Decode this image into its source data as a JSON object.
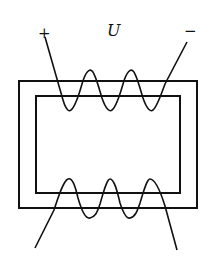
{
  "diagram": {
    "labels": {
      "positive": "+",
      "voltage": "U",
      "negative": "−"
    },
    "colors": {
      "stroke": "#111111",
      "background": "#ffffff"
    },
    "components": [
      {
        "name": "core-outer",
        "type": "rectangle"
      },
      {
        "name": "core-inner",
        "type": "rectangle"
      },
      {
        "name": "primary-winding",
        "position": "top",
        "turns": 3
      },
      {
        "name": "secondary-winding",
        "position": "bottom",
        "turns": 3
      }
    ]
  }
}
